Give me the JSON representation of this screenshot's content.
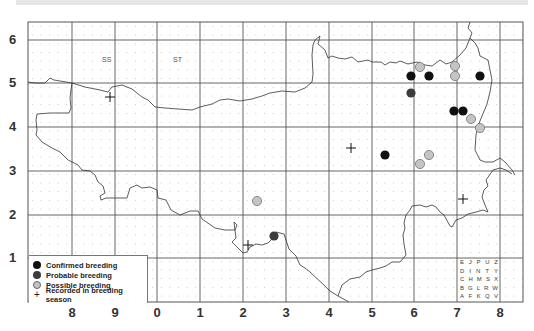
{
  "map": {
    "square_labels": [
      {
        "text": "SS",
        "x": 102,
        "y": 60
      },
      {
        "text": "ST",
        "x": 173,
        "y": 60
      }
    ],
    "y_axis_labels": [
      {
        "text": "6",
        "y": 40
      },
      {
        "text": "5",
        "y": 83
      },
      {
        "text": "4",
        "y": 127
      },
      {
        "text": "3",
        "y": 171
      },
      {
        "text": "2",
        "y": 215
      },
      {
        "text": "1",
        "y": 258
      }
    ],
    "x_axis_labels": [
      {
        "text": "8",
        "x": 72
      },
      {
        "text": "9",
        "x": 115
      },
      {
        "text": "0",
        "x": 157
      },
      {
        "text": "1",
        "x": 200
      },
      {
        "text": "2",
        "x": 243
      },
      {
        "text": "3",
        "x": 286
      },
      {
        "text": "4",
        "x": 329
      },
      {
        "text": "5",
        "x": 372
      },
      {
        "text": "6",
        "x": 414
      },
      {
        "text": "7",
        "x": 457
      },
      {
        "text": "8",
        "x": 500
      }
    ],
    "colors": {
      "confirmed": "#111111",
      "probable": "#3c3c3c",
      "possible": "#c4c4c4",
      "grid": "#555555",
      "coast": "#333333"
    },
    "records": {
      "confirmed": [
        {
          "x": 411,
          "y": 76
        },
        {
          "x": 429,
          "y": 76
        },
        {
          "x": 480,
          "y": 76
        },
        {
          "x": 454,
          "y": 111
        },
        {
          "x": 463,
          "y": 111
        },
        {
          "x": 385,
          "y": 155
        }
      ],
      "probable": [
        {
          "x": 411,
          "y": 93
        },
        {
          "x": 274,
          "y": 236
        }
      ],
      "possible": [
        {
          "x": 420,
          "y": 67
        },
        {
          "x": 455,
          "y": 66
        },
        {
          "x": 455,
          "y": 76
        },
        {
          "x": 471,
          "y": 119
        },
        {
          "x": 480,
          "y": 128
        },
        {
          "x": 429,
          "y": 155
        },
        {
          "x": 420,
          "y": 164
        },
        {
          "x": 257,
          "y": 201
        }
      ],
      "recorded_in_season": [
        {
          "x": 110,
          "y": 97
        },
        {
          "x": 351,
          "y": 148
        },
        {
          "x": 463,
          "y": 199
        },
        {
          "x": 248,
          "y": 245
        }
      ]
    }
  },
  "legend": {
    "items": [
      {
        "label": "Confirmed breeding",
        "symbol": "confirmed"
      },
      {
        "label": "Probable breeding",
        "symbol": "probable"
      },
      {
        "label": "Possible breeding",
        "symbol": "possible"
      },
      {
        "label": "Recorded in breeding season",
        "symbol": "cross"
      }
    ]
  },
  "tetrad_key": {
    "rows": [
      [
        "E",
        "J",
        "P",
        "U",
        "Z"
      ],
      [
        "D",
        "I",
        "N",
        "T",
        "Y"
      ],
      [
        "C",
        "H",
        "M",
        "S",
        "X"
      ],
      [
        "B",
        "G",
        "L",
        "R",
        "W"
      ],
      [
        "A",
        "F",
        "K",
        "Q",
        "V"
      ]
    ]
  }
}
